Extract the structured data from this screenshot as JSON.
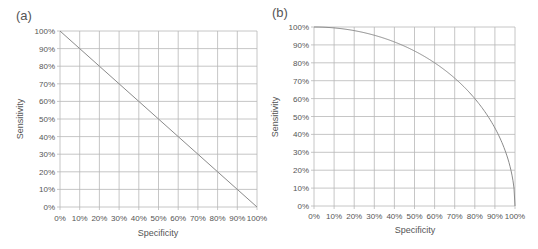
{
  "chart_data": [
    {
      "panel": "(a)",
      "type": "line",
      "title": "(a)",
      "xlabel": "Specificity",
      "ylabel": "Sensitivity",
      "xlim": [
        0,
        100
      ],
      "ylim": [
        0,
        100
      ],
      "grid": true,
      "x_ticks": [
        "0%",
        "10%",
        "20%",
        "30%",
        "40%",
        "50%",
        "60%",
        "70%",
        "80%",
        "90%",
        "100%"
      ],
      "y_ticks": [
        "0%",
        "10%",
        "20%",
        "30%",
        "40%",
        "50%",
        "60%",
        "70%",
        "80%",
        "90%",
        "100%"
      ],
      "series": [
        {
          "name": "ROC (a)",
          "x": [
            0,
            10,
            20,
            30,
            40,
            50,
            60,
            70,
            80,
            90,
            100
          ],
          "values": [
            100,
            90,
            80,
            70,
            60,
            50,
            40,
            30,
            20,
            10,
            0
          ]
        }
      ]
    },
    {
      "panel": "(b)",
      "type": "line",
      "title": "(b)",
      "xlabel": "Specificity",
      "ylabel": "Sensitivity",
      "xlim": [
        0,
        100
      ],
      "ylim": [
        0,
        100
      ],
      "grid": true,
      "x_ticks": [
        "0%",
        "10%",
        "20%",
        "30%",
        "40%",
        "50%",
        "60%",
        "70%",
        "80%",
        "90%",
        "100%"
      ],
      "y_ticks": [
        "0%",
        "10%",
        "20%",
        "30%",
        "40%",
        "50%",
        "60%",
        "70%",
        "80%",
        "90%",
        "100%"
      ],
      "series": [
        {
          "name": "ROC (b)",
          "x": [
            0,
            10,
            20,
            30,
            40,
            50,
            60,
            70,
            80,
            90,
            95,
            98,
            100
          ],
          "values": [
            100,
            99.5,
            98,
            95.4,
            91.7,
            86.6,
            80,
            71.4,
            60,
            43.6,
            31.2,
            19.9,
            0
          ]
        }
      ]
    }
  ],
  "colors": {
    "grid": "#b8b8b8",
    "axis": "#999999",
    "line": "#8a8a8a",
    "text": "#555555"
  }
}
